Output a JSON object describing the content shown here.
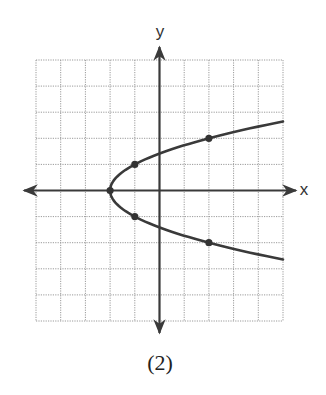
{
  "figure": {
    "caption": "(2)"
  },
  "colors": {
    "grid": "#9a9a9a",
    "axis": "#3a3a3a",
    "curve": "#3a3a3a",
    "point": "#333333",
    "background": "#ffffff"
  },
  "chart_data": {
    "type": "line",
    "title": "",
    "caption": "(2)",
    "xlabel": "x",
    "ylabel": "y",
    "xlim": [
      -5,
      5
    ],
    "ylim": [
      -5,
      5
    ],
    "grid": true,
    "grid_style": "dotted",
    "tick_labels": false,
    "equation": "x = y^2 - 2",
    "series": [
      {
        "name": "parabola opening right",
        "vertex": [
          -2,
          0
        ],
        "marked_points": [
          [
            -2,
            0
          ],
          [
            -1,
            1
          ],
          [
            -1,
            -1
          ],
          [
            2,
            2
          ],
          [
            2,
            -2
          ]
        ],
        "x_range": [
          -2,
          5
        ]
      }
    ],
    "legend": null
  }
}
